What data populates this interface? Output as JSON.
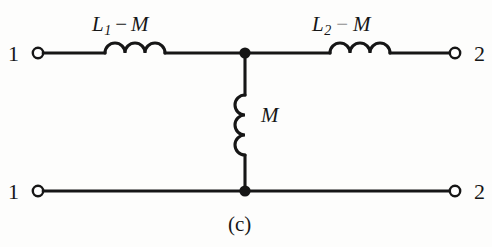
{
  "figure": {
    "caption": "(c)",
    "type": "equivalent-t-network-of-coupled-inductors",
    "background_color": "#fdfdfc",
    "ink_color": "#161616"
  },
  "terminals": {
    "top_left": {
      "label": "1",
      "marker": "open-circle",
      "x": 38,
      "y": 53
    },
    "top_right": {
      "label": "2",
      "marker": "open-circle",
      "x": 455,
      "y": 53
    },
    "bottom_left": {
      "label": "1",
      "marker": "open-circle",
      "x": 38,
      "y": 191
    },
    "bottom_right": {
      "label": "2",
      "marker": "open-circle",
      "x": 455,
      "y": 191
    }
  },
  "components": [
    {
      "id": "inductor-left",
      "symbol": "inductor",
      "orientation": "horizontal",
      "coils": 3,
      "label_main": "L",
      "label_sub": "1",
      "label_operator": "−",
      "label_operand": "M",
      "label_text": "L₁ − M"
    },
    {
      "id": "inductor-right",
      "symbol": "inductor",
      "orientation": "horizontal",
      "coils": 3,
      "label_main": "L",
      "label_sub": "2",
      "label_operator": "−",
      "label_operand": "M",
      "label_text": "L₂ − M"
    },
    {
      "id": "inductor-shunt",
      "symbol": "inductor",
      "orientation": "vertical",
      "coils": 3,
      "label_main": "M",
      "label_text": "M"
    }
  ],
  "junctions": [
    {
      "id": "node-top",
      "x": 245,
      "y": 53,
      "style": "filled-dot"
    },
    {
      "id": "node-bottom",
      "x": 245,
      "y": 191,
      "style": "filled-dot"
    }
  ],
  "labels": {
    "left_inductor_L": "L",
    "left_inductor_sub": "1",
    "left_inductor_minus": "−",
    "left_inductor_M": "M",
    "right_inductor_L": "L",
    "right_inductor_sub": "2",
    "right_inductor_minus": "−",
    "right_inductor_M": "M",
    "shunt_inductor": "M",
    "terminal_top_left": "1",
    "terminal_top_right": "2",
    "terminal_bottom_left": "1",
    "terminal_bottom_right": "2",
    "caption": "(c)"
  }
}
